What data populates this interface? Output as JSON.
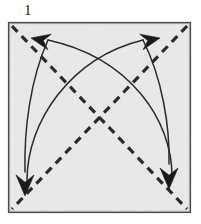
{
  "figure": {
    "step_label": "1",
    "canvas": {
      "width": 201,
      "height": 224
    }
  },
  "colors": {
    "page_background": "#ffffff",
    "paper_fill": "#e9e9e7",
    "paper_border": "#4a4a4a",
    "crease_line": "#2b2b2b",
    "arrow_line": "#2b2b2b",
    "arrow_head": "#1a1a1a",
    "label_text": "#1a1a1a"
  },
  "paper": {
    "shape": "square",
    "x": 9,
    "y": 23,
    "width": 181,
    "height": 189,
    "border_width": 2.2
  },
  "creases": [
    {
      "name": "diagonal-crease-tl-br",
      "style": "dashed",
      "dash": "8 6",
      "stroke_width": 3.2,
      "x1": 12,
      "y1": 26,
      "x2": 187,
      "y2": 209
    },
    {
      "name": "diagonal-crease-tr-bl",
      "style": "dashed",
      "dash": "8 6",
      "stroke_width": 3.2,
      "x1": 187,
      "y1": 26,
      "x2": 12,
      "y2": 209
    }
  ],
  "arrows": [
    {
      "name": "fold-arrow-to-top-left",
      "description": "curved arrow sweeping from bottom-right region up to the top-left corner",
      "path": "M 172,176 C 172,120 130,58 48,40",
      "stroke_width": 1.5,
      "head": {
        "tip_x": 31,
        "tip_y": 38,
        "angle_deg": 192,
        "length": 19,
        "half_width": 8
      }
    },
    {
      "name": "fold-arrow-to-top-right",
      "description": "curved arrow sweeping from bottom-left region up to the top-right corner",
      "path": "M 27,180 C 27,122 70,58 143,40",
      "stroke_width": 1.5,
      "head": {
        "tip_x": 160,
        "tip_y": 38,
        "angle_deg": 348,
        "length": 19,
        "half_width": 8
      }
    },
    {
      "name": "fold-arrow-to-bottom-left",
      "description": "curved arrow descending to the bottom-left corner",
      "path": "M 48,40 C 30,80 24,130 25,172",
      "stroke_width": 1.5,
      "head": {
        "tip_x": 25,
        "tip_y": 196,
        "angle_deg": 90,
        "length": 21,
        "half_width": 9
      }
    },
    {
      "name": "fold-arrow-to-bottom-right",
      "description": "curved arrow descending to the bottom-right corner",
      "path": "M 143,40 C 162,78 170,126 169,164",
      "stroke_width": 1.5,
      "head": {
        "tip_x": 169,
        "tip_y": 189,
        "angle_deg": 90,
        "length": 21,
        "half_width": 9
      }
    }
  ]
}
